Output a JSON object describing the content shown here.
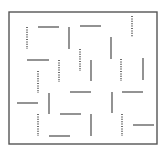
{
  "diagram": {
    "type": "segment-grid-puzzle",
    "background": "#ffffff",
    "border": {
      "x": 9,
      "y": 12,
      "width": 148,
      "height": 132,
      "color": "#555555",
      "stroke_width": 1.4
    },
    "style": {
      "solid_color": "#4a4a4a",
      "dotted_color": "#4a4a4a",
      "stroke_width": 1.2
    },
    "segments": [
      {
        "kind": "dotted",
        "orientation": "vertical",
        "x1": 27,
        "y1": 27,
        "x2": 27,
        "y2": 49
      },
      {
        "kind": "solid",
        "orientation": "horizontal",
        "x1": 38,
        "y1": 27,
        "x2": 59,
        "y2": 27
      },
      {
        "kind": "solid",
        "orientation": "vertical",
        "x1": 69,
        "y1": 27,
        "x2": 69,
        "y2": 49
      },
      {
        "kind": "solid",
        "orientation": "horizontal",
        "x1": 80,
        "y1": 26,
        "x2": 101,
        "y2": 26
      },
      {
        "kind": "dotted",
        "orientation": "vertical",
        "x1": 132,
        "y1": 16,
        "x2": 132,
        "y2": 37
      },
      {
        "kind": "solid",
        "orientation": "vertical",
        "x1": 111,
        "y1": 37,
        "x2": 111,
        "y2": 59
      },
      {
        "kind": "dotted",
        "orientation": "vertical",
        "x1": 80,
        "y1": 49,
        "x2": 80,
        "y2": 71
      },
      {
        "kind": "solid",
        "orientation": "horizontal",
        "x1": 27,
        "y1": 60,
        "x2": 49,
        "y2": 60
      },
      {
        "kind": "dotted",
        "orientation": "vertical",
        "x1": 59,
        "y1": 60,
        "x2": 59,
        "y2": 82
      },
      {
        "kind": "solid",
        "orientation": "vertical",
        "x1": 91,
        "y1": 60,
        "x2": 91,
        "y2": 81
      },
      {
        "kind": "dotted",
        "orientation": "vertical",
        "x1": 121,
        "y1": 59,
        "x2": 121,
        "y2": 81
      },
      {
        "kind": "solid",
        "orientation": "vertical",
        "x1": 143,
        "y1": 58,
        "x2": 143,
        "y2": 80
      },
      {
        "kind": "dotted",
        "orientation": "vertical",
        "x1": 38,
        "y1": 71,
        "x2": 38,
        "y2": 93
      },
      {
        "kind": "solid",
        "orientation": "horizontal",
        "x1": 70,
        "y1": 92,
        "x2": 91,
        "y2": 92
      },
      {
        "kind": "solid",
        "orientation": "vertical",
        "x1": 112,
        "y1": 92,
        "x2": 112,
        "y2": 113
      },
      {
        "kind": "solid",
        "orientation": "horizontal",
        "x1": 122,
        "y1": 92,
        "x2": 143,
        "y2": 92
      },
      {
        "kind": "solid",
        "orientation": "horizontal",
        "x1": 17,
        "y1": 103,
        "x2": 38,
        "y2": 103
      },
      {
        "kind": "solid",
        "orientation": "vertical",
        "x1": 49,
        "y1": 93,
        "x2": 49,
        "y2": 114
      },
      {
        "kind": "solid",
        "orientation": "horizontal",
        "x1": 60,
        "y1": 114,
        "x2": 81,
        "y2": 114
      },
      {
        "kind": "solid",
        "orientation": "vertical",
        "x1": 91,
        "y1": 114,
        "x2": 91,
        "y2": 136
      },
      {
        "kind": "dotted",
        "orientation": "vertical",
        "x1": 38,
        "y1": 114,
        "x2": 38,
        "y2": 136
      },
      {
        "kind": "solid",
        "orientation": "horizontal",
        "x1": 49,
        "y1": 136,
        "x2": 70,
        "y2": 136
      },
      {
        "kind": "dotted",
        "orientation": "vertical",
        "x1": 122,
        "y1": 114,
        "x2": 122,
        "y2": 136
      },
      {
        "kind": "solid",
        "orientation": "horizontal",
        "x1": 133,
        "y1": 125,
        "x2": 154,
        "y2": 125
      }
    ]
  }
}
